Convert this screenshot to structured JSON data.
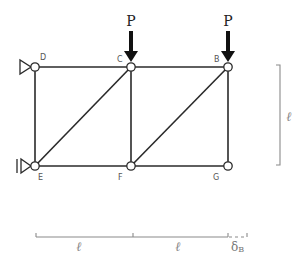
{
  "diagram": {
    "type": "truss",
    "colors": {
      "member": "#2a2a2a",
      "dimension": "#8a8a8a",
      "node_fill": "#ffffff"
    },
    "nodes": {
      "D": {
        "label": "D",
        "x": 35,
        "y": 67
      },
      "C": {
        "label": "C",
        "x": 131,
        "y": 67
      },
      "B": {
        "label": "B",
        "x": 228,
        "y": 67
      },
      "E": {
        "label": "E",
        "x": 35,
        "y": 166
      },
      "F": {
        "label": "F",
        "x": 131,
        "y": 166
      },
      "G": {
        "label": "G",
        "x": 228,
        "y": 166
      }
    },
    "members": [
      [
        "D",
        "C"
      ],
      [
        "C",
        "B"
      ],
      [
        "E",
        "F"
      ],
      [
        "F",
        "G"
      ],
      [
        "D",
        "E"
      ],
      [
        "C",
        "F"
      ],
      [
        "B",
        "G"
      ],
      [
        "E",
        "C"
      ],
      [
        "F",
        "B"
      ]
    ],
    "supports": [
      {
        "node": "D",
        "type": "pin"
      },
      {
        "node": "E",
        "type": "roller"
      }
    ],
    "loads": [
      {
        "node": "C",
        "label": "P",
        "direction": "down"
      },
      {
        "node": "B",
        "label": "P",
        "direction": "down"
      }
    ],
    "dimensions": {
      "horizontal": [
        {
          "label": "ℓ",
          "from": "E",
          "to": "F"
        },
        {
          "label": "ℓ",
          "from": "F",
          "to": "G"
        }
      ],
      "vertical": {
        "label": "ℓ"
      },
      "deflection": {
        "symbol": "δ",
        "subscript": "B"
      }
    }
  }
}
